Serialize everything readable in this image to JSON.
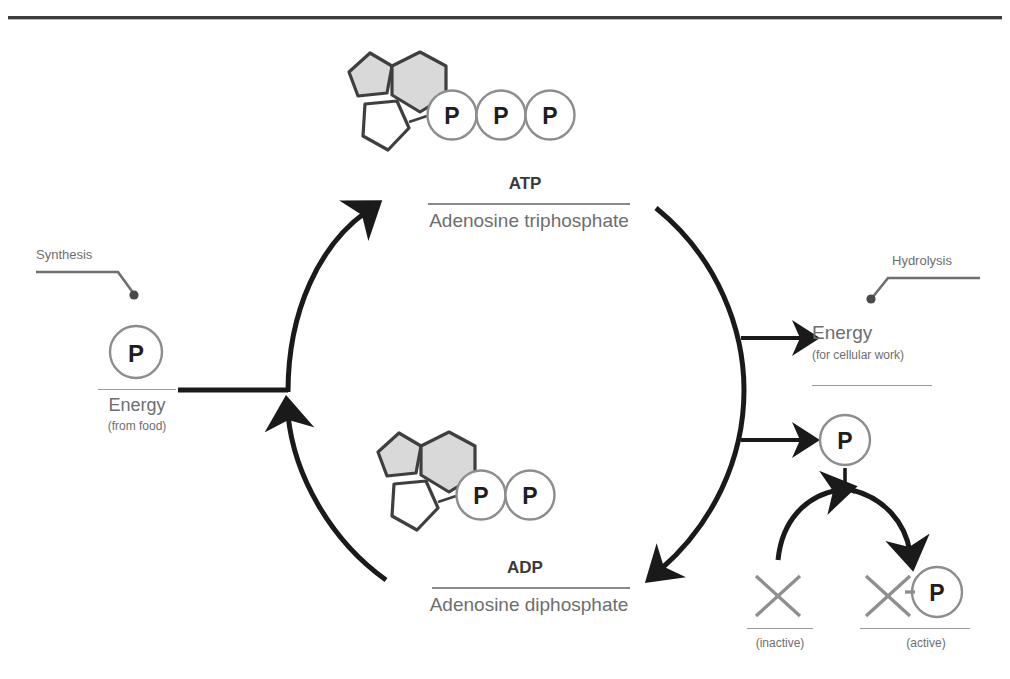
{
  "page": {
    "width": 1010,
    "height": 679,
    "background": "#ffffff",
    "title_fragment": ""
  },
  "diagram": {
    "name": "ATP-ADP cycle",
    "colors": {
      "ink": "#1a1a1a",
      "label_gray": "#6e6e6e",
      "bold_gray": "#3a3a3a",
      "ring_fill_gray": "#d9d9d9",
      "ring_stroke": "#3f3f3f",
      "circle_stroke": "#8d8d8d",
      "rule": "#8a8a8a",
      "background": "#ffffff"
    }
  },
  "atp": {
    "abbrev": "ATP",
    "full_name": "Adenosine triphosphate",
    "phosphate_count": 3,
    "phosphate_label": "P"
  },
  "adp": {
    "abbrev": "ADP",
    "full_name": "Adenosine diphosphate",
    "phosphate_count": 2,
    "phosphate_label": "P"
  },
  "left": {
    "process_label": "Synthesis",
    "phosphate_label": "P",
    "energy_label": "Energy",
    "energy_sublabel": "(from food)"
  },
  "right": {
    "process_label": "Hydrolysis",
    "energy_label": "Energy",
    "energy_sublabel": "(for cellular work)",
    "phosphate_label": "P"
  },
  "activation": {
    "inactive_symbol": "X",
    "inactive_label": "(inactive)",
    "active_symbol": "X",
    "active_bond": "-",
    "active_phosphate_label": "P",
    "active_label": "(active)"
  }
}
